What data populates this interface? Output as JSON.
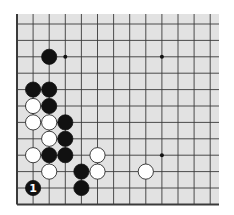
{
  "diagram": {
    "type": "go-board-partial",
    "board_color": "#e2e2e2",
    "line_color": "#3a3a3a",
    "columns": 13,
    "rows": 12,
    "edges": [
      "left",
      "bottom"
    ],
    "star_points": [
      [
        3,
        2
      ],
      [
        9,
        2
      ],
      [
        9,
        8
      ]
    ],
    "stones": [
      {
        "col": 2,
        "row": 2,
        "color": "black"
      },
      {
        "col": 1,
        "row": 4,
        "color": "black"
      },
      {
        "col": 2,
        "row": 4,
        "color": "black"
      },
      {
        "col": 1,
        "row": 5,
        "color": "white"
      },
      {
        "col": 2,
        "row": 5,
        "color": "black"
      },
      {
        "col": 1,
        "row": 6,
        "color": "white"
      },
      {
        "col": 2,
        "row": 6,
        "color": "white"
      },
      {
        "col": 3,
        "row": 6,
        "color": "black"
      },
      {
        "col": 2,
        "row": 7,
        "color": "white"
      },
      {
        "col": 3,
        "row": 7,
        "color": "black"
      },
      {
        "col": 1,
        "row": 8,
        "color": "white"
      },
      {
        "col": 2,
        "row": 8,
        "color": "black"
      },
      {
        "col": 3,
        "row": 8,
        "color": "black"
      },
      {
        "col": 5,
        "row": 8,
        "color": "white"
      },
      {
        "col": 2,
        "row": 9,
        "color": "white"
      },
      {
        "col": 4,
        "row": 9,
        "color": "black"
      },
      {
        "col": 5,
        "row": 9,
        "color": "white"
      },
      {
        "col": 8,
        "row": 9,
        "color": "white"
      },
      {
        "col": 1,
        "row": 10,
        "color": "black",
        "label": "1"
      },
      {
        "col": 4,
        "row": 10,
        "color": "black"
      }
    ]
  }
}
